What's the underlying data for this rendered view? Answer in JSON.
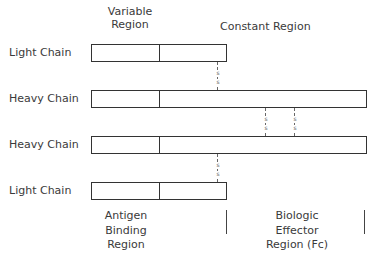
{
  "headers": {
    "variable_line1": "Variable",
    "variable_line2": "Region",
    "constant": "Constant Region"
  },
  "chains": [
    {
      "label": "Light Chain",
      "type": "light"
    },
    {
      "label": "Heavy Chain",
      "type": "heavy"
    },
    {
      "label": "Heavy Chain",
      "type": "heavy"
    },
    {
      "label": "Light Chain",
      "type": "light"
    }
  ],
  "bonds": {
    "symbol": "s"
  },
  "footer": {
    "antigen_line1": "Antigen",
    "antigen_line2": "Binding",
    "antigen_line3": "Region",
    "effector_line1": "Biologic",
    "effector_line2": "Effector",
    "effector_line3": "Region (Fc)"
  }
}
